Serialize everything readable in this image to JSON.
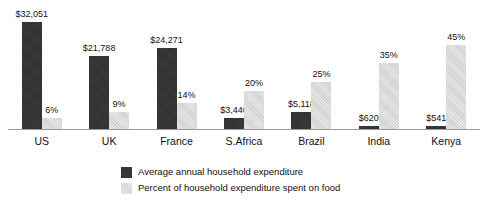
{
  "chart_data": {
    "type": "bar",
    "title": "",
    "subtitle": "",
    "xlabel": "",
    "ylabel": "",
    "grid": false,
    "legend_position": "bottom",
    "categories": [
      "US",
      "UK",
      "France",
      "S.Africa",
      "Brazil",
      "India",
      "Kenya"
    ],
    "series": [
      {
        "name": "Average annual household expenditure",
        "color": "#333333",
        "unit": "USD",
        "values": [
          32051,
          21788,
          24271,
          3440,
          5118,
          620,
          541
        ],
        "labels": [
          "$32,051",
          "$21,788",
          "$24,271",
          "$3,440",
          "$5,118",
          "$620",
          "$541"
        ],
        "axis_max": 32051
      },
      {
        "name": "Percent of household expenditure spent on food",
        "color": "#d5d5d5",
        "unit": "percent",
        "values": [
          6,
          9,
          14,
          20,
          25,
          35,
          45
        ],
        "labels": [
          "6%",
          "9%",
          "14%",
          "20%",
          "25%",
          "35%",
          "45%"
        ],
        "axis_max": 57
      }
    ]
  },
  "legend": {
    "items": [
      {
        "label": "Average annual household expenditure",
        "swatch": "dark"
      },
      {
        "label": "Percent of household expenditure spent on food",
        "swatch": "light"
      }
    ]
  }
}
